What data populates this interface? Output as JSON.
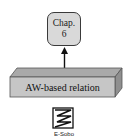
{
  "diagram": {
    "chapter_node": {
      "line1": "Chap.",
      "line2": "6",
      "fill": "#d9d9d9",
      "border": "#3a3a3a"
    },
    "relation_slab": {
      "label": "AW-based relation",
      "front_fill": "#c6c6c6",
      "top_fill": "#a9a9a9",
      "side_fill": "#8f8f8f"
    },
    "edge": {
      "from": "relation_slab",
      "to": "chapter_node",
      "direction": "up",
      "color": "#111111"
    },
    "source_icon": {
      "icon": "zigzag-document-icon",
      "caption": "E-Sobo"
    }
  }
}
